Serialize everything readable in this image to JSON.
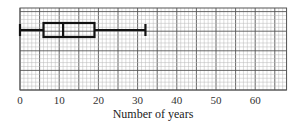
{
  "chart_data": {
    "type": "boxplot",
    "title": "",
    "xlabel": "Number of years",
    "ylabel": "",
    "xlim": [
      0,
      68
    ],
    "xticks": [
      0,
      10,
      20,
      30,
      40,
      50,
      60
    ],
    "grid": true,
    "minor_grid_step": 1,
    "major_grid_step": 5,
    "box": {
      "min": 0,
      "q1": 6,
      "median": 11,
      "q3": 19,
      "max": 32
    }
  },
  "colors": {
    "grid_major": "#555555",
    "grid_minor": "#b8b8b8",
    "box": "#111111",
    "background": "#ffffff"
  }
}
